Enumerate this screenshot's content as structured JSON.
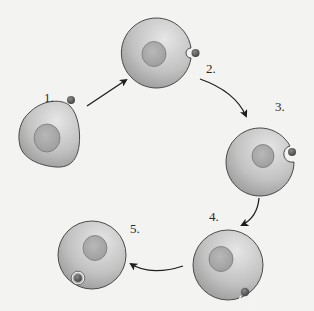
{
  "diagram": {
    "type": "cycle",
    "background_color": "#f3f3f1",
    "colors": {
      "cell_fill_light": "#d9d9d9",
      "cell_fill_dark": "#9a9a9a",
      "cell_outline": "#4a4a4a",
      "nucleus_fill": "#a9a9a9",
      "nucleus_outline": "#7a7a7a",
      "particle_fill": "#5c5c5c",
      "vesicle_ring": "#f5f5f5",
      "arrow": "#1e1e1e"
    },
    "steps": [
      {
        "label": "1.",
        "description": "particle approaches cell"
      },
      {
        "label": "2.",
        "description": "particle contacts membrane"
      },
      {
        "label": "3.",
        "description": "membrane invaginates around particle"
      },
      {
        "label": "4.",
        "description": "membrane closes around particle"
      },
      {
        "label": "5.",
        "description": "particle enclosed in vesicle inside cell"
      }
    ],
    "arrows": [
      {
        "from": "1.",
        "to": "2."
      },
      {
        "from": "2.",
        "to": "3."
      },
      {
        "from": "3.",
        "to": "4."
      },
      {
        "from": "4.",
        "to": "5."
      }
    ]
  }
}
